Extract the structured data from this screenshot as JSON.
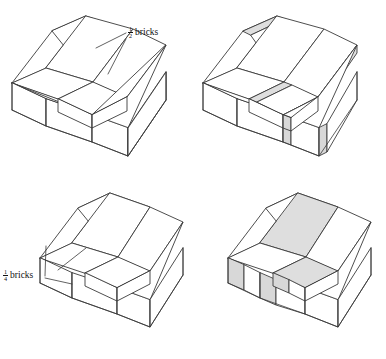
{
  "figure": {
    "background_color": "#ffffff",
    "line_color": "#3a3a3a",
    "shade_color": "#dedede",
    "panels": [
      {
        "id": "top-left",
        "name": "half-bond-plain",
        "description": "Isometric stack of bricks in half-bond arrangement, plain outline",
        "shaded": false,
        "label_ref": "half_bricks"
      },
      {
        "id": "top-right",
        "name": "half-bond-shaded",
        "description": "Same half-bond arrangement with shaded joint bricks",
        "shaded": true,
        "label_ref": null
      },
      {
        "id": "bottom-left",
        "name": "quarter-bond-plain",
        "description": "Isometric stack of bricks in quarter-bond arrangement, plain outline",
        "shaded": false,
        "label_ref": "quarter_bricks"
      },
      {
        "id": "bottom-right",
        "name": "quarter-bond-shaded",
        "description": "Same quarter-bond arrangement with shaded joint bricks",
        "shaded": true,
        "label_ref": null
      }
    ]
  },
  "labels": {
    "half_bricks": {
      "numerator": "1",
      "denominator": "2",
      "word": "bricks"
    },
    "quarter_bricks": {
      "numerator": "1",
      "denominator": "4",
      "word": "bricks"
    }
  }
}
